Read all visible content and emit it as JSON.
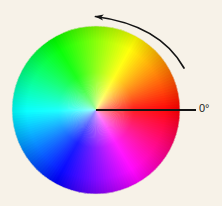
{
  "figure": {
    "name": "hue-color-wheel",
    "background_color": "#f7f2e8",
    "alt": "Hue color wheel with 0 degrees at right and counter-clockwise direction arrow"
  },
  "wheel": {
    "center_x": 96,
    "center_y": 110,
    "radius": 84,
    "zero_angle_position": "right",
    "direction": "counter-clockwise",
    "saturation_percent": 100,
    "value_percent": 100,
    "center_highlight": "all hues converge at center"
  },
  "chart_data": {
    "type": "pie",
    "title": "",
    "xlabel": "",
    "ylabel": "",
    "legend_position": "none",
    "grid": false,
    "categories": [
      "0° red",
      "30° orange",
      "60° yellow",
      "90° yellow-green",
      "120° green",
      "150° spring green",
      "180° cyan",
      "210° azure",
      "240° blue",
      "270° violet",
      "300° magenta",
      "330° rose"
    ],
    "values": [
      30,
      30,
      30,
      30,
      30,
      30,
      30,
      30,
      30,
      30,
      30,
      30
    ],
    "colors": [
      "#ff0000",
      "#ff8000",
      "#ffff00",
      "#80ff00",
      "#00ff00",
      "#00ff80",
      "#00ffff",
      "#0080ff",
      "#0000ff",
      "#8000ff",
      "#ff00ff",
      "#ff0080"
    ],
    "angles_deg": [
      0,
      30,
      60,
      90,
      120,
      150,
      180,
      210,
      240,
      270,
      300,
      330
    ]
  },
  "annotations": {
    "zero_degree": {
      "label": "0°",
      "line_color": "#141414",
      "line_from_x": 96,
      "line_from_y": 110,
      "line_to_x": 196,
      "line_to_y": 110
    },
    "direction_arrow": {
      "label": "",
      "color": "#141414",
      "meaning": "counter-clockwise increasing hue angle",
      "tip_x": 92,
      "tip_y": 16,
      "tail_x": 184,
      "tail_y": 68
    }
  }
}
